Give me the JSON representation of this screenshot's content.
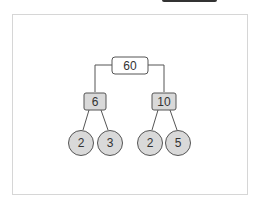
{
  "diagram": {
    "type": "factor-tree",
    "root": {
      "label": "60"
    },
    "level1": [
      {
        "label": "6",
        "children": [
          {
            "label": "2"
          },
          {
            "label": "3"
          }
        ]
      },
      {
        "label": "10",
        "children": [
          {
            "label": "2"
          },
          {
            "label": "5"
          }
        ]
      }
    ]
  },
  "colors": {
    "root_fill": "#ffffff",
    "box_fill": "#d9d9d9",
    "circle_fill": "#d9d9d9",
    "stroke": "#555555",
    "frame_border": "#d6d6d6",
    "top_bar": "#333333"
  }
}
